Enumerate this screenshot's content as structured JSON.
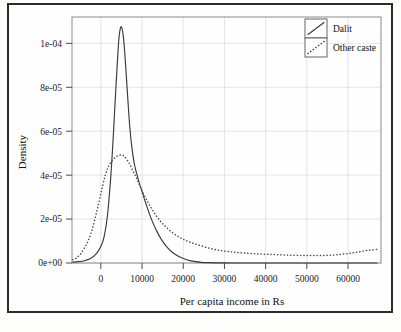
{
  "chart_data": {
    "type": "line",
    "title": "",
    "subtitle": "",
    "xlabel": "Per capita income in Rs",
    "ylabel": "Density",
    "xlim": [
      -7000,
      68000
    ],
    "ylim": [
      0,
      0.000112
    ],
    "grid": true,
    "legend_position": "top-right",
    "xticks": [
      0,
      10000,
      20000,
      30000,
      40000,
      50000,
      60000
    ],
    "xticklabels": [
      "0",
      "10000",
      "20000",
      "30000",
      "40000",
      "50000",
      "60000"
    ],
    "yticks": [
      0,
      2e-05,
      4e-05,
      6e-05,
      8e-05,
      0.0001
    ],
    "yticklabels": [
      "0e+00",
      "2e-05",
      "4e-05",
      "6e-05",
      "8e-05",
      "1e-04"
    ],
    "series": [
      {
        "name": "Dalit",
        "style": "solid",
        "color": "#3a3a3a",
        "x": [
          -6800,
          -5500,
          -4000,
          -2500,
          -1200,
          0,
          800,
          1600,
          2400,
          3000,
          3600,
          4200,
          4600,
          5000,
          5400,
          5800,
          6400,
          7000,
          7600,
          8200,
          8800,
          9400,
          10000,
          10800,
          11600,
          12600,
          13600,
          14800,
          16000,
          17400,
          18800,
          20200,
          21600,
          23000,
          24400,
          26000,
          28000,
          30000,
          34000,
          38000,
          42000,
          46000,
          50000,
          54000,
          58000,
          62000,
          67000
        ],
        "y": [
          4e-07,
          6e-07,
          1e-06,
          2e-06,
          4e-06,
          7.5e-06,
          1.2e-05,
          2.15e-05,
          3.9e-05,
          5.7e-05,
          7.8e-05,
          9.75e-05,
          0.0001055,
          0.0001075,
          0.000104,
          9.6e-05,
          7.9e-05,
          6.25e-05,
          5.15e-05,
          4.45e-05,
          4e-05,
          3.6e-05,
          3.25e-05,
          2.78e-05,
          2.34e-05,
          1.85e-05,
          1.44e-05,
          1.04e-05,
          7.3e-06,
          4.8e-06,
          3.1e-06,
          1.9e-06,
          1.1e-06,
          6e-07,
          3e-07,
          1.5e-07,
          6e-08,
          3e-08,
          1e-08,
          1e-08,
          1e-08,
          1e-08,
          1e-08,
          1e-08,
          1e-08,
          1e-08,
          1e-08
        ]
      },
      {
        "name": "Other caste",
        "style": "dotted",
        "color": "#4a4a4a",
        "x": [
          -6800,
          -6000,
          -5000,
          -4000,
          -3000,
          -2000,
          -1000,
          0,
          1000,
          2000,
          3000,
          4000,
          5000,
          5600,
          6200,
          7000,
          8000,
          9000,
          10000,
          11000,
          12000,
          13200,
          14400,
          15600,
          17000,
          18500,
          20000,
          21500,
          23000,
          25000,
          27000,
          29000,
          31000,
          33000,
          35000,
          37500,
          40000,
          42500,
          45000,
          47500,
          50000,
          52500,
          55000,
          57500,
          60000,
          62500,
          65000,
          67000
        ],
        "y": [
          1.5e-06,
          2.2e-06,
          4e-06,
          6.8e-06,
          1.05e-05,
          1.6e-05,
          2.35e-05,
          3.15e-05,
          3.95e-05,
          4.45e-05,
          4.72e-05,
          4.87e-05,
          4.92e-05,
          4.87e-05,
          4.74e-05,
          4.5e-05,
          4.12e-05,
          3.72e-05,
          3.3e-05,
          2.92e-05,
          2.58e-05,
          2.22e-05,
          1.92e-05,
          1.68e-05,
          1.44e-05,
          1.24e-05,
          1.08e-05,
          9.6e-06,
          8.6e-06,
          7.4e-06,
          6.4e-06,
          5.7e-06,
          5.2e-06,
          4.8e-06,
          4.5e-06,
          4.2e-06,
          4e-06,
          3.8e-06,
          3.6e-06,
          3.5e-06,
          3.4e-06,
          3.4e-06,
          3.5e-06,
          3.8e-06,
          4.3e-06,
          5e-06,
          5.8e-06,
          6.2e-06
        ]
      }
    ],
    "legend": [
      {
        "label": "Dalit",
        "style": "solid"
      },
      {
        "label": "Other caste",
        "style": "dotted"
      }
    ]
  }
}
